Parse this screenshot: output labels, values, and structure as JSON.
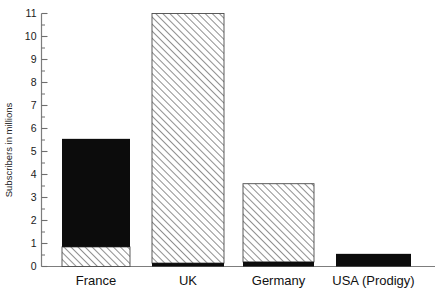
{
  "chart_data": {
    "type": "bar",
    "title": "",
    "xlabel": "",
    "ylabel": "Subscribers in millions",
    "categories": [
      "France",
      "UK",
      "Germany",
      "USA (Prodigy)"
    ],
    "ylim": [
      0,
      11
    ],
    "yticks": [
      0,
      1,
      2,
      3,
      4,
      5,
      6,
      7,
      8,
      9,
      10,
      11
    ],
    "ytick_labels": [
      "0",
      "1",
      "2",
      "3",
      "4",
      "5",
      "6",
      "7",
      "8",
      "9",
      "10",
      "11"
    ],
    "minor_ticks": true,
    "minor_tick_step": 0.5,
    "grid": false,
    "legend": "none",
    "stacked": true,
    "series": [
      {
        "name": "online-service-segment",
        "fill": "hatched",
        "values": [
          0.85,
          11.0,
          3.6,
          0.0
        ]
      },
      {
        "name": "provider-segment",
        "fill": "solid-black",
        "values": [
          5.55,
          0.15,
          0.2,
          0.55
        ]
      }
    ],
    "bars": [
      {
        "category": "France",
        "total": 5.55,
        "hatched_from": 0.0,
        "hatched_to": 0.85,
        "black_from": 0.85,
        "black_to": 5.55
      },
      {
        "category": "UK",
        "total": 11.0,
        "hatched_from": 0.15,
        "hatched_to": 11.0,
        "black_from": 0.0,
        "black_to": 0.15
      },
      {
        "category": "Germany",
        "total": 3.6,
        "hatched_from": 0.2,
        "hatched_to": 3.6,
        "black_from": 0.0,
        "black_to": 0.2
      },
      {
        "category": "USA (Prodigy)",
        "total": 0.55,
        "hatched_from": 0.0,
        "hatched_to": 0.0,
        "black_from": 0.0,
        "black_to": 0.55
      }
    ],
    "colors": {
      "solid": "#0c0c0c",
      "hatch_line": "#6b6b6b",
      "hatch_bg": "#ffffff",
      "axis": "#7d7d7d"
    }
  },
  "axis": {
    "y_title": "Subscribers in millions",
    "y_labels": [
      "11",
      "10",
      "9",
      "8",
      "7",
      "6",
      "5",
      "4",
      "3",
      "2",
      "1",
      "0"
    ],
    "x_labels": [
      "France",
      "UK",
      "Germany",
      "USA (Prodigy)"
    ]
  }
}
